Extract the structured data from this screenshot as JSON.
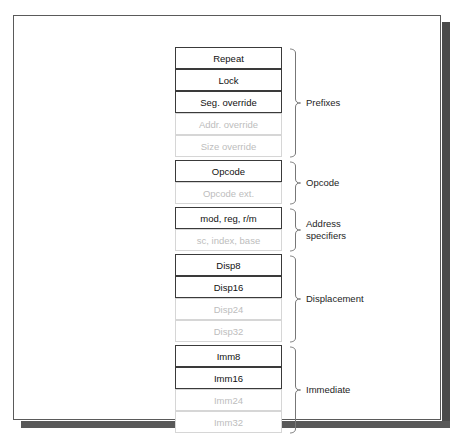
{
  "figure": {
    "background_color": "#ffffff",
    "frame_border_color": "#5a5a5a",
    "shadow_color": "#4a4a4a",
    "active_text_color": "#111111",
    "active_border_color": "#3a3a3a",
    "dim_text_color": "#bdbdbd",
    "dim_border_color": "#d6d6d6"
  },
  "diagram": {
    "type": "block-stack",
    "row_height_px": 22,
    "box_width_px": 107,
    "groups": [
      {
        "id": "prefixes",
        "label": "Prefixes",
        "rows": [
          {
            "label": "Repeat",
            "state": "active"
          },
          {
            "label": "Lock",
            "state": "active"
          },
          {
            "label": "Seg. override",
            "state": "active"
          },
          {
            "label": "Addr. override",
            "state": "dim"
          },
          {
            "label": "Size override",
            "state": "dim"
          }
        ]
      },
      {
        "id": "opcode",
        "label": "Opcode",
        "rows": [
          {
            "label": "Opcode",
            "state": "active"
          },
          {
            "label": "Opcode ext.",
            "state": "dim"
          }
        ]
      },
      {
        "id": "address-specifiers",
        "label": "Address\nspecifiers",
        "rows": [
          {
            "label": "mod, reg, r/m",
            "state": "active"
          },
          {
            "label": "sc, index, base",
            "state": "dim"
          }
        ]
      },
      {
        "id": "displacement",
        "label": "Displacement",
        "rows": [
          {
            "label": "Disp8",
            "state": "active"
          },
          {
            "label": "Disp16",
            "state": "active"
          },
          {
            "label": "Disp24",
            "state": "dim"
          },
          {
            "label": "Disp32",
            "state": "dim"
          }
        ]
      },
      {
        "id": "immediate",
        "label": "Immediate",
        "rows": [
          {
            "label": "Imm8",
            "state": "active"
          },
          {
            "label": "Imm16",
            "state": "active"
          },
          {
            "label": "Imm24",
            "state": "dim"
          },
          {
            "label": "Imm32",
            "state": "dim"
          }
        ]
      }
    ]
  }
}
